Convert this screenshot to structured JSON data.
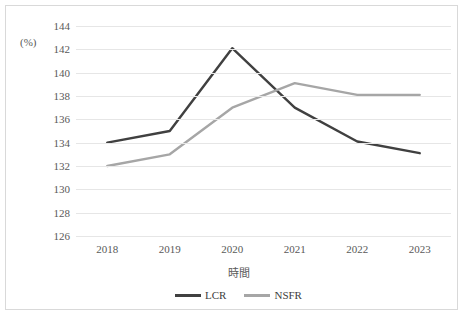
{
  "axis": {
    "y_title": "(%)",
    "x_title": "時間",
    "y_ticks": [
      "144",
      "142",
      "140",
      "138",
      "136",
      "134",
      "132",
      "130",
      "128",
      "126"
    ],
    "x_ticks": [
      "2018",
      "2019",
      "2020",
      "2021",
      "2022",
      "2023"
    ]
  },
  "legend": {
    "items": [
      {
        "label": "LCR",
        "color": "#404040"
      },
      {
        "label": "NSFR",
        "color": "#a6a6a6"
      }
    ]
  },
  "chart_data": {
    "type": "line",
    "title": "",
    "xlabel": "時間",
    "ylabel": "(%)",
    "categories": [
      "2018",
      "2019",
      "2020",
      "2021",
      "2022",
      "2023"
    ],
    "ylim": [
      126,
      144
    ],
    "ytick_step": 2,
    "grid": true,
    "legend_position": "bottom",
    "series": [
      {
        "name": "LCR",
        "color": "#404040",
        "values": [
          134.0,
          135.0,
          142.1,
          137.0,
          134.1,
          133.1
        ]
      },
      {
        "name": "NSFR",
        "color": "#a6a6a6",
        "values": [
          132.0,
          133.0,
          137.0,
          139.1,
          138.1,
          138.1
        ]
      }
    ]
  }
}
